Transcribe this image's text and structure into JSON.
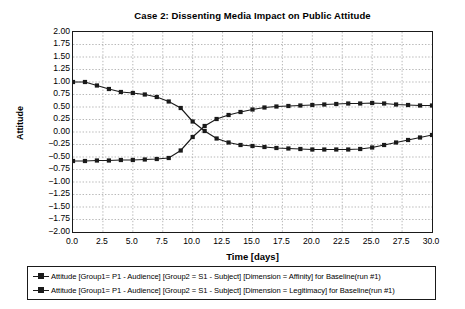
{
  "chart_data": {
    "type": "line",
    "title": "Case 2: Dissenting Media Impact on Public Attitude",
    "xlabel": "Time [days]",
    "ylabel": "Attitude",
    "xlim": [
      0,
      30
    ],
    "ylim": [
      -2.0,
      2.0
    ],
    "grid": true,
    "legend_position": "below-plot",
    "xticks": [
      "0.0",
      "2.5",
      "5.0",
      "7.5",
      "10.0",
      "12.5",
      "15.0",
      "17.5",
      "20.0",
      "22.5",
      "25.0",
      "27.5",
      "30.0"
    ],
    "xtick_values": [
      0,
      2.5,
      5,
      7.5,
      10,
      12.5,
      15,
      17.5,
      20,
      22.5,
      25,
      27.5,
      30
    ],
    "yticks": [
      "2.00",
      "1.75",
      "1.50",
      "1.25",
      "1.00",
      "0.75",
      "0.50",
      "0.25",
      "0.00",
      "−0.25",
      "−0.50",
      "−0.75",
      "−1.00",
      "−1.25",
      "−1.50",
      "−1.75",
      "−2.00"
    ],
    "ytick_values": [
      2.0,
      1.75,
      1.5,
      1.25,
      1.0,
      0.75,
      0.5,
      0.25,
      0.0,
      -0.25,
      -0.5,
      -0.75,
      -1.0,
      -1.25,
      -1.5,
      -1.75,
      -2.0
    ],
    "x": [
      0,
      1,
      2,
      3,
      4,
      5,
      6,
      7,
      8,
      9,
      10,
      11,
      12,
      13,
      14,
      15,
      16,
      17,
      18,
      19,
      20,
      21,
      22,
      23,
      24,
      25,
      26,
      27,
      28,
      29,
      30
    ],
    "series": [
      {
        "name": "Attitude [Group1= P1 - Audience] [Group2 = S1 - Subject] [Dimension = Affinity] for Baseline(run #1)",
        "marker": "square",
        "color": "#1a1a1a",
        "values": [
          1.0,
          1.0,
          0.93,
          0.86,
          0.8,
          0.78,
          0.75,
          0.7,
          0.61,
          0.48,
          0.21,
          0.02,
          -0.13,
          -0.21,
          -0.26,
          -0.28,
          -0.3,
          -0.32,
          -0.33,
          -0.34,
          -0.35,
          -0.35,
          -0.35,
          -0.35,
          -0.34,
          -0.31,
          -0.26,
          -0.21,
          -0.16,
          -0.11,
          -0.06
        ]
      },
      {
        "name": "Attitude [Group1= P1 - Audience] [Group2 = S1 - Subject] [Dimension = Legitimacy] for Baseline(run #1)",
        "marker": "square",
        "color": "#1a1a1a",
        "values": [
          -0.58,
          -0.58,
          -0.57,
          -0.57,
          -0.56,
          -0.56,
          -0.55,
          -0.54,
          -0.52,
          -0.37,
          -0.1,
          0.12,
          0.26,
          0.34,
          0.4,
          0.45,
          0.49,
          0.51,
          0.52,
          0.53,
          0.54,
          0.55,
          0.56,
          0.57,
          0.57,
          0.58,
          0.57,
          0.55,
          0.54,
          0.53,
          0.53
        ]
      }
    ]
  },
  "legend": {
    "entries": [
      "Attitude [Group1= P1 - Audience] [Group2 = S1 - Subject] [Dimension = Affinity] for Baseline(run #1)",
      "Attitude [Group1= P1 - Audience] [Group2 = S1 - Subject] [Dimension = Legitimacy] for Baseline(run #1)"
    ]
  }
}
